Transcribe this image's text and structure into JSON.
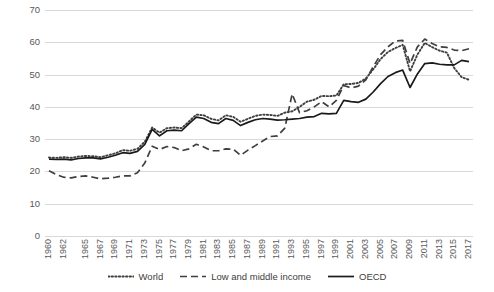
{
  "chart_data": {
    "type": "line",
    "title": "",
    "xlabel": "",
    "ylabel": "",
    "ylim": [
      0,
      70
    ],
    "ytick_step": 10,
    "yticks": [
      "0",
      "10",
      "20",
      "30",
      "40",
      "50",
      "60",
      "70"
    ],
    "grid": "horizontal",
    "legend_position": "bottom-center",
    "x_start": 1960,
    "x_end": 2017,
    "xticks": [
      "1960",
      "1962",
      "1965",
      "1967",
      "1969",
      "1971",
      "1973",
      "1975",
      "1977",
      "1979",
      "1981",
      "1983",
      "1985",
      "1987",
      "1989",
      "1991",
      "1993",
      "1995",
      "1997",
      "1999",
      "2001",
      "2003",
      "2005",
      "2007",
      "2009",
      "2011",
      "2013",
      "2015",
      "2017"
    ],
    "x": [
      1960,
      1961,
      1962,
      1963,
      1964,
      1965,
      1966,
      1967,
      1968,
      1969,
      1970,
      1971,
      1972,
      1973,
      1974,
      1975,
      1976,
      1977,
      1978,
      1979,
      1980,
      1981,
      1982,
      1983,
      1984,
      1985,
      1986,
      1987,
      1988,
      1989,
      1990,
      1991,
      1992,
      1993,
      1994,
      1995,
      1996,
      1997,
      1998,
      1999,
      2000,
      2001,
      2002,
      2003,
      2004,
      2005,
      2006,
      2007,
      2008,
      2009,
      2010,
      2011,
      2012,
      2013,
      2014,
      2015,
      2016,
      2017
    ],
    "series": [
      {
        "name": "World",
        "style": "dotted",
        "color": "#3f3f3f",
        "values": [
          24.3,
          24.2,
          24.4,
          24.2,
          24.6,
          24.8,
          24.7,
          24.4,
          25.0,
          25.6,
          26.6,
          26.4,
          27.0,
          29.2,
          33.6,
          32.0,
          33.4,
          33.6,
          33.4,
          35.5,
          37.6,
          37.4,
          36.3,
          35.8,
          37.4,
          36.9,
          35.4,
          36.3,
          37.2,
          37.6,
          37.5,
          37.2,
          38.2,
          38.6,
          40.0,
          41.6,
          42.2,
          43.4,
          43.3,
          43.5,
          47.0,
          47.1,
          47.4,
          48.8,
          51.6,
          54.8,
          57.0,
          58.2,
          59.2,
          51.0,
          56.2,
          59.8,
          58.5,
          57.4,
          56.8,
          52.0,
          49.2,
          48.4
        ]
      },
      {
        "name": "Low and middle income",
        "style": "dashed",
        "color": "#3f3f3f",
        "values": [
          20.2,
          19.0,
          18.2,
          18.0,
          18.4,
          18.6,
          18.2,
          17.7,
          17.9,
          18.2,
          18.6,
          18.6,
          19.6,
          22.6,
          27.8,
          26.8,
          27.7,
          27.4,
          26.4,
          27.0,
          28.4,
          27.6,
          26.4,
          26.4,
          27.0,
          26.9,
          25.0,
          26.6,
          28.0,
          29.4,
          30.8,
          31.0,
          33.4,
          44.0,
          38.2,
          38.8,
          40.0,
          41.6,
          40.0,
          42.0,
          46.6,
          45.9,
          46.4,
          48.4,
          52.4,
          56.2,
          58.6,
          60.4,
          60.6,
          53.4,
          58.6,
          61.0,
          59.6,
          58.6,
          58.4,
          57.6,
          57.4,
          58.0
        ]
      },
      {
        "name": "OECD",
        "style": "solid",
        "color": "#1a1a1a",
        "values": [
          23.8,
          23.7,
          23.8,
          23.6,
          24.0,
          24.2,
          24.2,
          23.9,
          24.4,
          25.0,
          25.8,
          25.6,
          26.2,
          28.4,
          33.0,
          31.0,
          32.6,
          32.8,
          32.6,
          34.8,
          36.8,
          36.4,
          35.2,
          34.8,
          36.4,
          35.8,
          34.2,
          35.2,
          36.0,
          36.4,
          36.2,
          35.9,
          36.0,
          36.2,
          36.4,
          36.8,
          37.0,
          38.0,
          37.8,
          38.0,
          42.0,
          41.6,
          41.4,
          42.4,
          44.6,
          47.2,
          49.4,
          50.6,
          51.4,
          46.0,
          50.2,
          53.4,
          53.6,
          53.2,
          53.0,
          53.0,
          54.4,
          54.0
        ]
      }
    ]
  },
  "legend": {
    "items": [
      {
        "label": "World"
      },
      {
        "label": "Low and middle income"
      },
      {
        "label": "OECD"
      }
    ]
  }
}
